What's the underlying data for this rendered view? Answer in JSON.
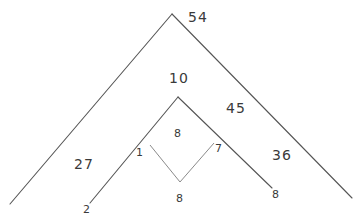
{
  "diagram": {
    "type": "hand-drawn number pyramid",
    "labels": {
      "outer_top": "54",
      "inner_top": "10",
      "right_region": "45",
      "inner_center": "8",
      "left_region": "27",
      "right_outer_region": "36",
      "inner_left_corner": "1",
      "inner_right_corner": "7",
      "bottom_left": "2",
      "bottom_middle": "8",
      "bottom_right": "8"
    }
  }
}
